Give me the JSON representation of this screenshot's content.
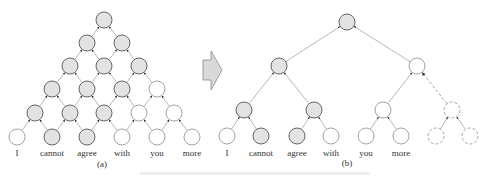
{
  "panel_a": {
    "caption": "(a)",
    "words": [
      "I",
      "cannot",
      "agree",
      "with",
      "you",
      "more"
    ],
    "rows": [
      {
        "y": 20,
        "nodes": [
          {
            "x": 104,
            "fill": "gray"
          }
        ]
      },
      {
        "y": 43,
        "nodes": [
          {
            "x": 87,
            "fill": "gray"
          },
          {
            "x": 122,
            "fill": "gray"
          }
        ]
      },
      {
        "y": 66,
        "nodes": [
          {
            "x": 70,
            "fill": "gray"
          },
          {
            "x": 104,
            "fill": "gray"
          },
          {
            "x": 139,
            "fill": "gray"
          }
        ]
      },
      {
        "y": 89,
        "nodes": [
          {
            "x": 52,
            "fill": "gray"
          },
          {
            "x": 87,
            "fill": "gray"
          },
          {
            "x": 122,
            "fill": "gray"
          },
          {
            "x": 157,
            "fill": "white"
          }
        ]
      },
      {
        "y": 113,
        "nodes": [
          {
            "x": 35,
            "fill": "gray"
          },
          {
            "x": 70,
            "fill": "gray"
          },
          {
            "x": 104,
            "fill": "gray"
          },
          {
            "x": 139,
            "fill": "white"
          },
          {
            "x": 174,
            "fill": "white"
          }
        ]
      },
      {
        "y": 137,
        "nodes": [
          {
            "x": 17,
            "fill": "white"
          },
          {
            "x": 52,
            "fill": "gray"
          },
          {
            "x": 87,
            "fill": "gray"
          },
          {
            "x": 122,
            "fill": "white"
          },
          {
            "x": 157,
            "fill": "white"
          },
          {
            "x": 192,
            "fill": "white"
          }
        ]
      }
    ]
  },
  "panel_b": {
    "caption": "(b)",
    "words": [
      "I",
      "cannot",
      "agree",
      "with",
      "you",
      "more"
    ],
    "nodes": [
      {
        "id": "root",
        "x": 347,
        "y": 22,
        "fill": "gray"
      },
      {
        "id": "L",
        "x": 279,
        "y": 66,
        "fill": "gray"
      },
      {
        "id": "R",
        "x": 417,
        "y": 66,
        "fill": "white"
      },
      {
        "id": "LL",
        "x": 244,
        "y": 110,
        "fill": "gray"
      },
      {
        "id": "LR",
        "x": 314,
        "y": 110,
        "fill": "gray"
      },
      {
        "id": "RL",
        "x": 383,
        "y": 110,
        "fill": "white"
      },
      {
        "id": "RR",
        "x": 452,
        "y": 110,
        "fill": "dashed"
      },
      {
        "id": "w0",
        "x": 227,
        "y": 136,
        "fill": "white"
      },
      {
        "id": "w1",
        "x": 261,
        "y": 136,
        "fill": "gray"
      },
      {
        "id": "w2",
        "x": 297,
        "y": 136,
        "fill": "gray"
      },
      {
        "id": "w3",
        "x": 331,
        "y": 136,
        "fill": "white"
      },
      {
        "id": "w4",
        "x": 366,
        "y": 136,
        "fill": "white"
      },
      {
        "id": "w5",
        "x": 401,
        "y": 136,
        "fill": "white"
      },
      {
        "id": "d0",
        "x": 436,
        "y": 136,
        "fill": "dashed"
      },
      {
        "id": "d1",
        "x": 470,
        "y": 136,
        "fill": "dashed"
      }
    ],
    "edges": [
      [
        "L",
        "root",
        "solid"
      ],
      [
        "R",
        "root",
        "solid"
      ],
      [
        "LL",
        "L",
        "solid"
      ],
      [
        "LR",
        "L",
        "solid"
      ],
      [
        "RL",
        "R",
        "solid"
      ],
      [
        "RR",
        "R",
        "dashed"
      ],
      [
        "w0",
        "LL",
        "solid"
      ],
      [
        "w1",
        "LL",
        "solid"
      ],
      [
        "w2",
        "LR",
        "solid"
      ],
      [
        "w3",
        "LR",
        "solid"
      ],
      [
        "w4",
        "RL",
        "solid"
      ],
      [
        "w5",
        "RL",
        "solid"
      ],
      [
        "d0",
        "RR",
        "solid"
      ],
      [
        "d1",
        "RR",
        "solid"
      ]
    ],
    "word_x": [
      227,
      261,
      297,
      331,
      366,
      401
    ]
  },
  "arrow": {
    "direction": "right",
    "fill": "#d9d9d9",
    "stroke": "#888888"
  },
  "colors": {
    "gray_node": "#e3e3e3",
    "node_stroke": "#666666",
    "white_node_stroke": "#9a9a9a"
  }
}
